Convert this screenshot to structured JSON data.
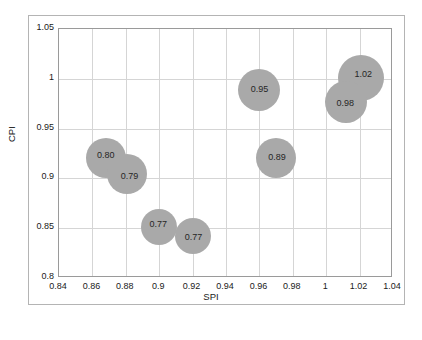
{
  "chart_data": {
    "type": "scatter",
    "title": "",
    "xlabel": "SPI",
    "ylabel": "CPI",
    "xlim": [
      0.84,
      1.04
    ],
    "ylim": [
      0.8,
      1.05
    ],
    "xticks": [
      "0.84",
      "0.86",
      "0.88",
      "0.9",
      "0.92",
      "0.94",
      "0.96",
      "0.98",
      "1",
      "1.02",
      "1.04"
    ],
    "xtick_values": [
      0.84,
      0.86,
      0.88,
      0.9,
      0.92,
      0.94,
      0.96,
      0.98,
      1.0,
      1.02,
      1.04
    ],
    "yticks": [
      "0.8",
      "0.85",
      "0.9",
      "0.95",
      "1",
      "1.05"
    ],
    "ytick_values": [
      0.8,
      0.85,
      0.9,
      0.95,
      1.0,
      1.05
    ],
    "grid": true,
    "legend": "none",
    "points": [
      {
        "label": "0.80",
        "spi": 0.868,
        "cpi": 0.92,
        "radius": 20,
        "label_dx": 0,
        "label_dy": -2
      },
      {
        "label": "0.79",
        "spi": 0.881,
        "cpi": 0.904,
        "radius": 20,
        "label_dx": 2,
        "label_dy": 3
      },
      {
        "label": "0.77",
        "spi": 0.9,
        "cpi": 0.851,
        "radius": 18,
        "label_dx": -1,
        "label_dy": -2
      },
      {
        "label": "0.77",
        "spi": 0.92,
        "cpi": 0.842,
        "radius": 18,
        "label_dx": 1,
        "label_dy": 2
      },
      {
        "label": "0.95",
        "spi": 0.96,
        "cpi": 0.989,
        "radius": 21,
        "label_dx": 0,
        "label_dy": 0
      },
      {
        "label": "0.89",
        "spi": 0.97,
        "cpi": 0.92,
        "radius": 20,
        "label_dx": 1,
        "label_dy": 0
      },
      {
        "label": "1.02",
        "spi": 1.021,
        "cpi": 1.001,
        "radius": 23,
        "label_dx": 2,
        "label_dy": -3
      },
      {
        "label": "0.98",
        "spi": 1.012,
        "cpi": 0.977,
        "radius": 21,
        "label_dx": -1,
        "label_dy": 2
      }
    ]
  },
  "colors": {
    "bubble_fill": "#a9a9a9",
    "grid": "#d5d5d5",
    "axis_border": "#9a9a9a",
    "frame_border": "#b4b4b4",
    "text": "#1a1a1a",
    "background": "#ffffff"
  }
}
